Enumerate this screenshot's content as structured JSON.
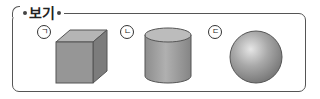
{
  "box": {
    "title": "보기",
    "items": [
      {
        "label": "ㄱ",
        "shape": "cube"
      },
      {
        "label": "ㄴ",
        "shape": "cylinder"
      },
      {
        "label": "ㄷ",
        "shape": "sphere"
      }
    ]
  },
  "colors": {
    "frame": "#555555",
    "shape_light": "#bdbdbd",
    "shape_mid": "#9a9a9a",
    "shape_dark": "#7a7a7a",
    "outline": "#555555"
  }
}
